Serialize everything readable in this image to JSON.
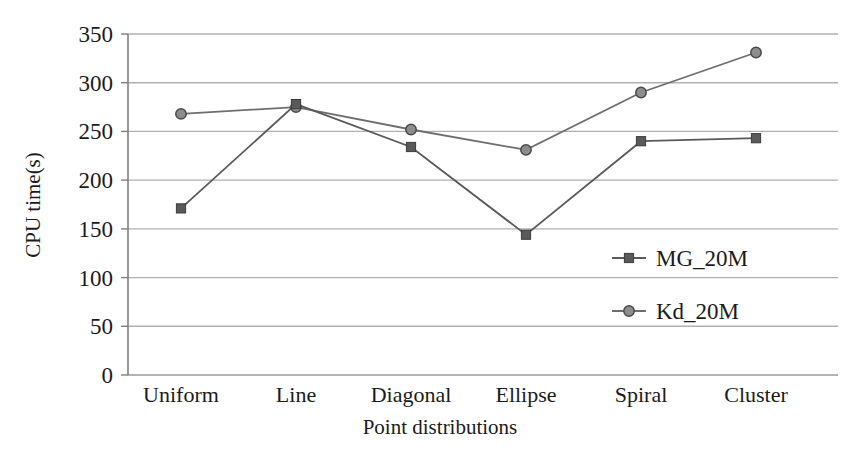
{
  "chart_data": {
    "type": "line",
    "title": "",
    "xlabel": "Point distributions",
    "ylabel": "CPU time(s)",
    "categories": [
      "Uniform",
      "Line",
      "Diagonal",
      "Ellipse",
      "Spiral",
      "Cluster"
    ],
    "series": [
      {
        "name": "MG_20M",
        "marker": "square",
        "color": "#5a5a5a",
        "values": [
          171,
          278,
          234,
          144,
          240,
          243
        ]
      },
      {
        "name": "Kd_20M",
        "marker": "circle",
        "color": "#6e6e6e",
        "values": [
          268,
          275,
          252,
          231,
          290,
          331
        ]
      }
    ],
    "ylim": [
      0,
      350
    ],
    "yticks": [
      0,
      50,
      100,
      150,
      200,
      250,
      300,
      350
    ],
    "ytick_labels": [
      "0",
      "50",
      "100",
      "150",
      "200",
      "250",
      "300",
      "350"
    ],
    "grid": "horizontal",
    "legend_position": "inside-right-middle",
    "colors": {
      "gridline": "#b3b3b3",
      "axis": "#7a7a7a",
      "series_mg": "#5a5a5a",
      "series_kd": "#6e6e6e",
      "text": "#1b1b1b",
      "background": "#ffffff"
    }
  },
  "legend": {
    "entries": [
      {
        "label": "MG_20M",
        "marker": "square-marker-icon"
      },
      {
        "label": "Kd_20M",
        "marker": "circle-marker-icon"
      }
    ]
  },
  "axes": {
    "y_title": "CPU time(s)",
    "x_title": "Point distributions"
  }
}
